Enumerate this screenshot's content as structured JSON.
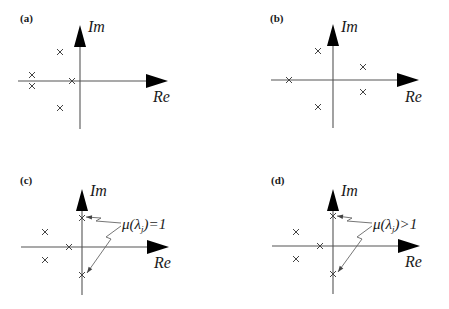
{
  "figure": {
    "axis_labels": {
      "real": "Re",
      "imag": "Im"
    },
    "colors": {
      "ink": "#000000",
      "axis": "#555555",
      "cross": "#444444",
      "background": "#ffffff"
    },
    "panels": [
      {
        "id": "a",
        "label": "(a)",
        "label_pos": [
          20,
          22
        ],
        "origin": [
          80,
          81
        ],
        "axis": {
          "x_from": 18,
          "x_to": 168,
          "y_from": 129,
          "y_to": 25
        },
        "im_label_pos": [
          88,
          32
        ],
        "re_label_pos": [
          153,
          102
        ],
        "poles": [
          [
            60,
            52
          ],
          [
            32,
            75
          ],
          [
            32,
            86
          ],
          [
            72,
            81
          ],
          [
            60,
            108
          ]
        ],
        "annotation": null
      },
      {
        "id": "b",
        "label": "(b)",
        "label_pos": [
          270,
          22
        ],
        "origin": [
          333,
          80
        ],
        "axis": {
          "x_from": 271,
          "x_to": 419,
          "y_from": 128,
          "y_to": 24
        },
        "im_label_pos": [
          341,
          32
        ],
        "re_label_pos": [
          405,
          102
        ],
        "poles": [
          [
            318,
            51
          ],
          [
            289,
            80
          ],
          [
            318,
            107
          ],
          [
            363,
            67
          ],
          [
            363,
            92
          ]
        ],
        "annotation": null
      },
      {
        "id": "c",
        "label": "(c)",
        "label_pos": [
          20,
          184
        ],
        "origin": [
          82,
          247
        ],
        "axis": {
          "x_from": 21,
          "x_to": 169,
          "y_from": 295,
          "y_to": 189
        },
        "im_label_pos": [
          90,
          196
        ],
        "re_label_pos": [
          154,
          268
        ],
        "poles": [
          [
            82,
            218
          ],
          [
            45,
            232
          ],
          [
            45,
            260
          ],
          [
            69,
            247
          ],
          [
            82,
            275
          ]
        ],
        "annotation": {
          "prefix": "μ(λ",
          "subscript": "j",
          "suffix": ")=1",
          "text_pos": [
            122,
            229
          ],
          "pointers": [
            {
              "points": [
                [
                  121,
                  223
                ],
                [
                  96,
                  221
                ],
                [
                  101,
                  218
                ],
                [
                  86,
                  217
                ]
              ]
            },
            {
              "points": [
                [
                  121,
                  226
                ],
                [
                  106,
                  237
                ],
                [
                  111,
                  239
                ],
                [
                  87,
                  273
                ]
              ]
            }
          ]
        }
      },
      {
        "id": "d",
        "label": "(d)",
        "label_pos": [
          271,
          184
        ],
        "origin": [
          333,
          246
        ],
        "axis": {
          "x_from": 272,
          "x_to": 420,
          "y_from": 294,
          "y_to": 189
        },
        "im_label_pos": [
          341,
          196
        ],
        "re_label_pos": [
          405,
          267
        ],
        "poles": [
          [
            333,
            216
          ],
          [
            296,
            232
          ],
          [
            296,
            259
          ],
          [
            320,
            246
          ],
          [
            333,
            274
          ]
        ],
        "annotation": {
          "prefix": "μ(λ",
          "subscript": "j",
          "suffix": ")>1",
          "text_pos": [
            373,
            229
          ],
          "pointers": [
            {
              "points": [
                [
                  372,
                  223
                ],
                [
                  347,
                  221
                ],
                [
                  352,
                  218
                ],
                [
                  337,
                  216
                ]
              ]
            },
            {
              "points": [
                [
                  372,
                  226
                ],
                [
                  357,
                  237
                ],
                [
                  362,
                  239
                ],
                [
                  338,
                  272
                ]
              ]
            }
          ]
        }
      }
    ]
  }
}
